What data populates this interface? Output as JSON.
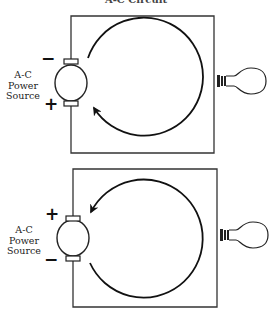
{
  "title": "A-C Circuit",
  "colors": {
    "line": "#222222",
    "background": "#ffffff"
  },
  "circuits": [
    {
      "id": "top",
      "source_label": [
        "A-C",
        "Power",
        "Source"
      ],
      "top_terminal_sign": "−",
      "bottom_terminal_sign": "+",
      "current_direction": "counterclockwise-arrow-at-lower-left",
      "load": "light-bulb"
    },
    {
      "id": "bottom",
      "source_label": [
        "A-C",
        "Power",
        "Source"
      ],
      "top_terminal_sign": "+",
      "bottom_terminal_sign": "−",
      "current_direction": "clockwise-arrow-at-upper-left",
      "load": "light-bulb"
    }
  ]
}
